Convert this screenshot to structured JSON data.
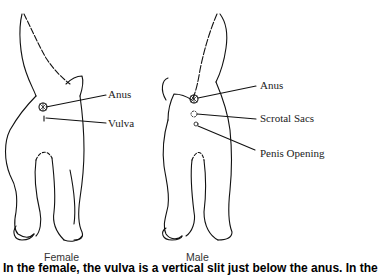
{
  "figures": [
    {
      "id": "female",
      "caption": "Female",
      "labels": [
        "Anus",
        "Vulva"
      ]
    },
    {
      "id": "male",
      "caption": "Male",
      "labels": [
        "Anus",
        "Scrotal Sacs",
        "Penis Opening"
      ]
    }
  ],
  "bottom_text": "In the female, the vulva is a vertical slit just below the anus. In the"
}
